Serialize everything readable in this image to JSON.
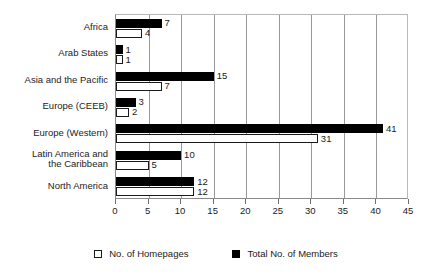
{
  "chart_data": {
    "type": "bar",
    "orientation": "horizontal",
    "title": "",
    "xlabel": "",
    "ylabel": "",
    "xlim": [
      0,
      45
    ],
    "xticks": [
      0,
      5,
      10,
      15,
      20,
      25,
      30,
      35,
      40,
      45
    ],
    "grid": true,
    "legend_position": "bottom",
    "categories": [
      "Africa",
      "Arab States",
      "Asia and the Pacific",
      "Europe (CEEB)",
      "Europe (Western)",
      "Latin America and\nthe Caribbean",
      "North America"
    ],
    "series": [
      {
        "name": "Total No. of Members",
        "color": "#000000",
        "style": "filled",
        "values": [
          7,
          1,
          15,
          3,
          41,
          10,
          12
        ]
      },
      {
        "name": "No. of Homepages",
        "color": "#ffffff",
        "style": "open",
        "values": [
          4,
          1,
          7,
          2,
          31,
          5,
          12
        ]
      }
    ]
  },
  "legend": {
    "items": [
      {
        "label": "No. of Homepages",
        "marker": "open-square-icon"
      },
      {
        "label": "Total No. of Members",
        "marker": "filled-square-icon"
      }
    ]
  }
}
